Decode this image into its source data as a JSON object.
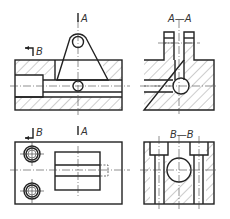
{
  "drawing": {
    "type": "orthographic technical drawing with section views",
    "views": [
      {
        "id": "front-view",
        "label": "",
        "description": "Front view, partial section through left bore"
      },
      {
        "id": "section-a-a",
        "label": "A—A",
        "description": "Section A-A on right side"
      },
      {
        "id": "top-view",
        "label": "",
        "description": "Top view with two counterbored holes"
      },
      {
        "id": "section-b-b",
        "label": "B—B",
        "description": "Section B-B"
      }
    ],
    "cutting_planes": [
      {
        "name": "A",
        "label": "A"
      },
      {
        "name": "B",
        "label": "B"
      },
      {
        "name": "A-bottom",
        "label": "A"
      },
      {
        "name": "B-bottom",
        "label": "B"
      }
    ],
    "colors": {
      "line": "#222222",
      "hatch": "#444444",
      "background": "#ffffff"
    }
  }
}
